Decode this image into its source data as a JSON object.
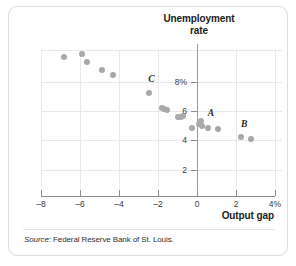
{
  "chart_data": {
    "type": "scatter",
    "title": "Unemployment rate",
    "xlabel": "Output gap",
    "ylabel": "Unemployment rate",
    "xlim": [
      -8,
      4
    ],
    "ylim": [
      0.6,
      10.6
    ],
    "grid": true,
    "legend": "none",
    "xticks": [
      {
        "value": -8,
        "label": "–8"
      },
      {
        "value": -6,
        "label": "–6"
      },
      {
        "value": -4,
        "label": "–4"
      },
      {
        "value": -2,
        "label": "–2"
      },
      {
        "value": 0,
        "label": "0"
      },
      {
        "value": 2,
        "label": "2"
      },
      {
        "value": 4,
        "label": "4%"
      }
    ],
    "yticks": [
      {
        "value": 8,
        "label": "8%"
      },
      {
        "value": 6,
        "label": "6"
      },
      {
        "value": 4,
        "label": "4"
      },
      {
        "value": 2,
        "label": "2"
      }
    ],
    "points": [
      {
        "x": -6.8,
        "y": 9.7
      },
      {
        "x": -5.9,
        "y": 9.9
      },
      {
        "x": -5.65,
        "y": 9.35
      },
      {
        "x": -4.85,
        "y": 8.85
      },
      {
        "x": -4.3,
        "y": 8.5
      },
      {
        "x": -2.45,
        "y": 7.25
      },
      {
        "x": -1.8,
        "y": 6.2
      },
      {
        "x": -1.7,
        "y": 6.15
      },
      {
        "x": -1.55,
        "y": 6.05
      },
      {
        "x": -1.0,
        "y": 5.6
      },
      {
        "x": -0.8,
        "y": 5.6
      },
      {
        "x": -0.7,
        "y": 5.65
      },
      {
        "x": -0.25,
        "y": 4.85
      },
      {
        "x": 0.1,
        "y": 5.15
      },
      {
        "x": 0.2,
        "y": 5.3
      },
      {
        "x": 0.25,
        "y": 4.95
      },
      {
        "x": 0.55,
        "y": 4.85
      },
      {
        "x": 1.1,
        "y": 4.75
      },
      {
        "x": 2.25,
        "y": 4.25
      },
      {
        "x": 2.75,
        "y": 4.1
      }
    ],
    "annotations": [
      {
        "label": "C",
        "x": -2.5,
        "y": 8.05
      },
      {
        "label": "A",
        "x": 0.55,
        "y": 5.75
      },
      {
        "label": "B",
        "x": 2.25,
        "y": 4.95
      }
    ]
  },
  "source": {
    "lead": "Source:",
    "text": " Federal Reserve Bank of St. Louis."
  },
  "colors": {
    "point": "#a8a8a8",
    "grid": "#e9e9e9",
    "axis": "#8c8c8c",
    "text": "#1c1c1c",
    "frame": "#dedede"
  }
}
